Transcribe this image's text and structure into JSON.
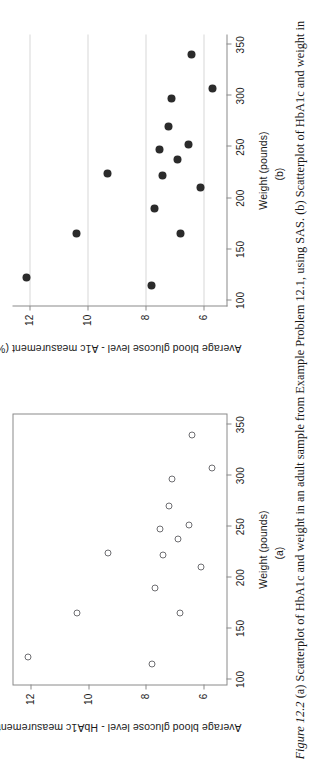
{
  "figure": {
    "number_label": "Figure 12.2",
    "caption_text": "  (a) Scatterplot of HbA1c and weight in an adult sample from Example Problem 12.1, using SAS. (b) Scatterplot of HbA1c and weight in"
  },
  "panels": [
    {
      "tag": "(a)"
    },
    {
      "tag": "(b)"
    }
  ],
  "colors": {
    "axis": "#8a8a8a",
    "grid": "#d8d8d8",
    "marker_open_stroke": "#6e6e72",
    "marker_filled": "#2b2b2b",
    "text": "#1a1a1a"
  },
  "chart_data": [
    {
      "type": "scatter",
      "panel": "(a)",
      "title": "",
      "xlabel": "Weight (pounds)",
      "ylabel": "Average blood glucose level - HbA1c measurement (%)",
      "xlim": [
        95,
        360
      ],
      "ylim": [
        5.2,
        12.6
      ],
      "xticks": [
        100,
        150,
        200,
        250,
        300,
        350
      ],
      "yticks": [
        6,
        8,
        10,
        12
      ],
      "xticklabels": [
        "100",
        "150",
        "200",
        "250",
        "300",
        "350"
      ],
      "yticklabels": [
        "6",
        "8",
        "10",
        "12"
      ],
      "grid": false,
      "frame": "box",
      "marker": "open-circle",
      "legend": null,
      "points": [
        {
          "x": 115,
          "y": 7.8
        },
        {
          "x": 122,
          "y": 12.1
        },
        {
          "x": 165,
          "y": 6.8
        },
        {
          "x": 165,
          "y": 10.4
        },
        {
          "x": 190,
          "y": 7.7
        },
        {
          "x": 210,
          "y": 6.1
        },
        {
          "x": 222,
          "y": 7.4
        },
        {
          "x": 224,
          "y": 9.3
        },
        {
          "x": 238,
          "y": 6.9
        },
        {
          "x": 248,
          "y": 7.5
        },
        {
          "x": 252,
          "y": 6.5
        },
        {
          "x": 270,
          "y": 7.2
        },
        {
          "x": 297,
          "y": 7.1
        },
        {
          "x": 307,
          "y": 5.7
        },
        {
          "x": 340,
          "y": 6.4
        }
      ]
    },
    {
      "type": "scatter",
      "panel": "(b)",
      "title": "",
      "xlabel": "Weight (pounds)",
      "ylabel": "Average blood glucose level - A1c measurement (%)",
      "xlim": [
        95,
        360
      ],
      "ylim": [
        5.2,
        12.6
      ],
      "xticks": [
        100,
        150,
        200,
        250,
        300,
        350
      ],
      "yticks": [
        6,
        8,
        10,
        12
      ],
      "xticklabels": [
        "100",
        "150",
        "200",
        "250",
        "300",
        "350"
      ],
      "yticklabels": [
        "6",
        "8",
        "10",
        "12"
      ],
      "grid": true,
      "gridlines_at_y": [
        6,
        8,
        10,
        12
      ],
      "frame": "left-bottom",
      "marker": "filled-circle",
      "legend": null,
      "points": [
        {
          "x": 115,
          "y": 7.8
        },
        {
          "x": 122,
          "y": 12.1
        },
        {
          "x": 165,
          "y": 6.8
        },
        {
          "x": 165,
          "y": 10.4
        },
        {
          "x": 190,
          "y": 7.7
        },
        {
          "x": 210,
          "y": 6.1
        },
        {
          "x": 222,
          "y": 7.4
        },
        {
          "x": 224,
          "y": 9.3
        },
        {
          "x": 238,
          "y": 6.9
        },
        {
          "x": 248,
          "y": 7.5
        },
        {
          "x": 252,
          "y": 6.5
        },
        {
          "x": 270,
          "y": 7.2
        },
        {
          "x": 297,
          "y": 7.1
        },
        {
          "x": 307,
          "y": 5.7
        },
        {
          "x": 340,
          "y": 6.4
        }
      ]
    }
  ]
}
